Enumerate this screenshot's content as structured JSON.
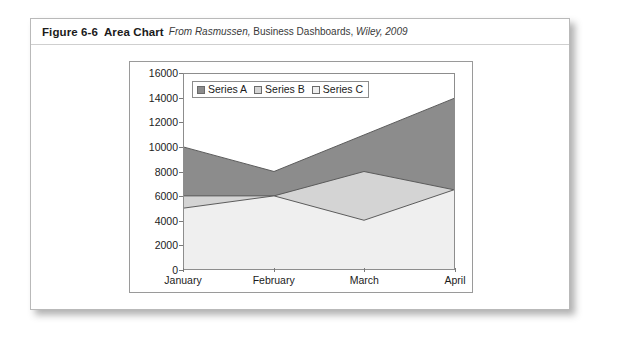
{
  "figure": {
    "number": "Figure 6-6",
    "title": "Area Chart",
    "source_prefix": "From Rasmussen,",
    "source_mid": "Business Dashboards,",
    "source_publisher": "Wiley,",
    "source_year": "2009"
  },
  "colors": {
    "series_a": "#8c8c8c",
    "series_b": "#d4d4d4",
    "series_c": "#efefef",
    "outline": "#5a5a5a",
    "axis": "#8d8d8d",
    "frame": "#9a9a9a",
    "panel_border": "#b9b9b9",
    "text": "#1b1b1b"
  },
  "chart_data": {
    "type": "area",
    "title": "",
    "xlabel": "",
    "ylabel": "",
    "categories": [
      "January",
      "February",
      "March",
      "April"
    ],
    "ylim": [
      0,
      16000
    ],
    "yticks": [
      0,
      2000,
      4000,
      6000,
      8000,
      10000,
      12000,
      14000,
      16000
    ],
    "ytick_labels": [
      "0",
      "2000",
      "4000",
      "6000",
      "8000",
      "10000",
      "12000",
      "14000",
      "16000"
    ],
    "grid": false,
    "stacked": false,
    "legend_position": "top-left",
    "series": [
      {
        "name": "Series A",
        "color": "#8c8c8c",
        "values": [
          10000,
          8000,
          11000,
          14000
        ]
      },
      {
        "name": "Series B",
        "color": "#d4d4d4",
        "values": [
          6000,
          6000,
          8000,
          6500
        ]
      },
      {
        "name": "Series C",
        "color": "#efefef",
        "values": [
          5000,
          6000,
          4000,
          6500
        ]
      }
    ]
  }
}
